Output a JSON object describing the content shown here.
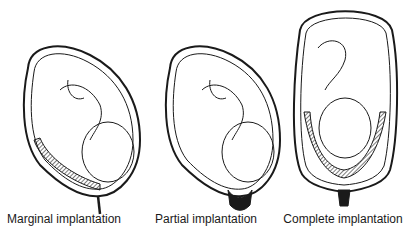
{
  "diagram": {
    "panels": [
      {
        "id": "marginal",
        "label": "Marginal implantation",
        "center_x": 64
      },
      {
        "id": "partial",
        "label": "Partial implantation",
        "center_x": 206
      },
      {
        "id": "complete",
        "label": "Complete implantation",
        "center_x": 343
      }
    ],
    "colors": {
      "line": "#1a1a1a",
      "placenta": "#3a3a3a",
      "background": "#ffffff"
    }
  }
}
